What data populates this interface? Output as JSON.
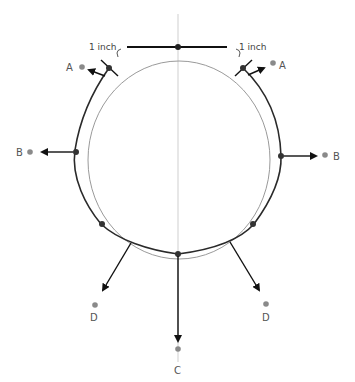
{
  "diagram": {
    "labels": {
      "a_left": "A",
      "a_right": "A",
      "b_left": "B",
      "b_right": "B",
      "c": "C",
      "d_left": "D",
      "d_right": "D",
      "inch_left": "1 inch",
      "inch_right": "1 inch"
    },
    "colors": {
      "outline": "#2a2a2a",
      "inner_circle": "#9a9a9a",
      "center_line": "#cccccc",
      "target_dot": "#8a8a8a",
      "point_dot": "#333333",
      "arrow": "#111111"
    }
  }
}
